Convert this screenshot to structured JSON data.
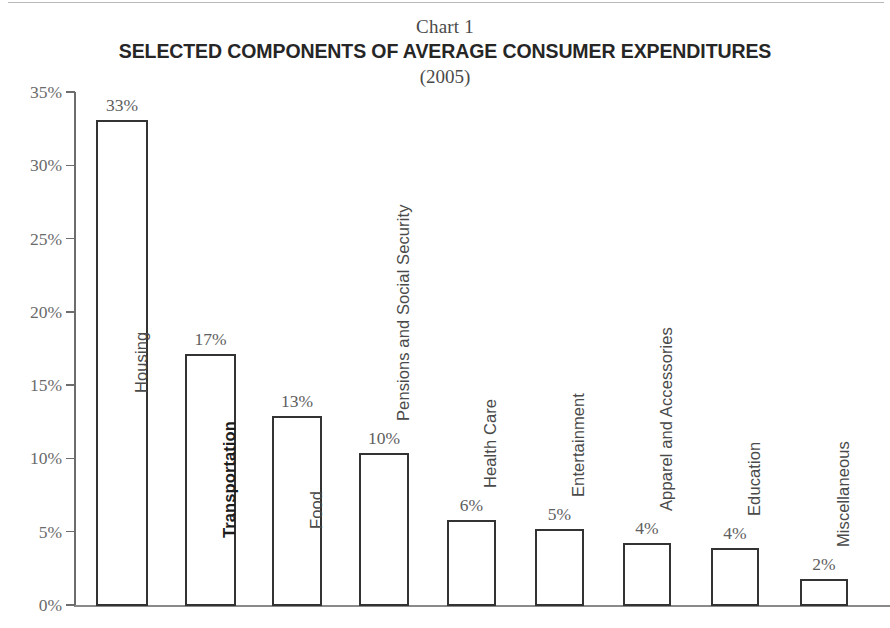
{
  "header": {
    "chart_number": "Chart 1",
    "title": "SELECTED COMPONENTS OF AVERAGE CONSUMER EXPENDITURES",
    "subtitle": "(2005)"
  },
  "colors": {
    "bar_border": "#333333",
    "bar_fill": "#ffffff",
    "axis": "#6d6d6d",
    "tick_label": "#6a6a6a",
    "value_label": "#5e5e5e",
    "category_label": "#4a4a4a",
    "highlight_label": "#1c1c1c",
    "title": "#262626",
    "page_background": "#ffffff"
  },
  "chart_data": {
    "type": "bar",
    "title": "SELECTED COMPONENTS OF AVERAGE CONSUMER EXPENDITURES",
    "subtitle": "(2005)",
    "chart_number": "Chart 1",
    "xlabel": "",
    "ylabel": "",
    "ylim": [
      0,
      35
    ],
    "grid": false,
    "legend": "none",
    "orientation": "vertical",
    "y_tick_labels": [
      "0%",
      "5%",
      "10%",
      "15%",
      "20%",
      "25%",
      "30%",
      "35%"
    ],
    "y_ticks": [
      0,
      5,
      10,
      15,
      20,
      25,
      30,
      35
    ],
    "categories": [
      "Housing",
      "Transportation",
      "Food",
      "Pensions and Social Security",
      "Health Care",
      "Entertainment",
      "Apparel and Accessories",
      "Education",
      "Miscellaneous"
    ],
    "values": [
      33,
      17,
      13,
      10,
      6,
      5,
      4,
      4,
      2
    ],
    "value_labels": [
      "33%",
      "17%",
      "13%",
      "10%",
      "6%",
      "5%",
      "4%",
      "4%",
      "2%"
    ],
    "exact_values": [
      33.1,
      17.1,
      12.9,
      10.4,
      5.8,
      5.2,
      4.2,
      3.9,
      1.8
    ],
    "highlighted_category": "Transportation"
  },
  "bars": [
    {
      "label": "Housing",
      "value_label": "33%",
      "height_pct": 33.1,
      "highlight": false,
      "x": 96,
      "width": 52,
      "label_mode": "inside"
    },
    {
      "label": "Transportation",
      "value_label": "17%",
      "height_pct": 17.1,
      "highlight": true,
      "x": 185,
      "width": 51,
      "label_mode": "inside"
    },
    {
      "label": "Food",
      "value_label": "13%",
      "height_pct": 12.9,
      "highlight": false,
      "x": 272,
      "width": 50,
      "label_mode": "inside"
    },
    {
      "label": "Pensions and Social Security",
      "value_label": "10%",
      "height_pct": 10.4,
      "highlight": false,
      "x": 359,
      "width": 50,
      "label_mode": "above"
    },
    {
      "label": "Health Care",
      "value_label": "6%",
      "height_pct": 5.8,
      "highlight": false,
      "x": 447,
      "width": 49,
      "label_mode": "above"
    },
    {
      "label": "Entertainment",
      "value_label": "5%",
      "height_pct": 5.2,
      "highlight": false,
      "x": 535,
      "width": 49,
      "label_mode": "above"
    },
    {
      "label": "Apparel and Accessories",
      "value_label": "4%",
      "height_pct": 4.2,
      "highlight": false,
      "x": 623,
      "width": 48,
      "label_mode": "above"
    },
    {
      "label": "Education",
      "value_label": "4%",
      "height_pct": 3.9,
      "highlight": false,
      "x": 711,
      "width": 48,
      "label_mode": "above"
    },
    {
      "label": "Miscellaneous",
      "value_label": "2%",
      "height_pct": 1.8,
      "highlight": false,
      "x": 800,
      "width": 48,
      "label_mode": "above"
    }
  ]
}
